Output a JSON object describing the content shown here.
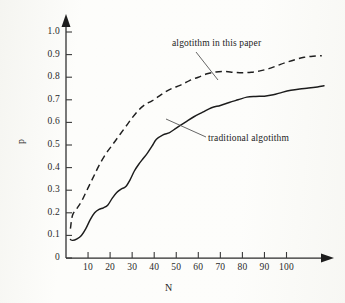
{
  "figure": {
    "kind": "scanned-line-chart",
    "background_color": "#fdfdfb",
    "ink_color": "#1f1f1f"
  },
  "axes": {
    "y_title": "p",
    "x_title": "N",
    "y_tick_labels": [
      "1.0",
      "0.9",
      "0.8",
      "0.7",
      "0.6",
      "0.5",
      "0.4",
      "0.3",
      "0.2",
      "0.1",
      "0"
    ],
    "x_tick_labels": [
      "10",
      "20",
      "30",
      "40",
      "50",
      "60",
      "70",
      "80",
      "90",
      "100"
    ]
  },
  "annotations": {
    "upper": "algotithm in this paper",
    "lower": "traditional algotithm"
  },
  "chart_data": {
    "type": "line",
    "title": "",
    "xlabel": "N",
    "ylabel": "p",
    "xlim": [
      0,
      118
    ],
    "ylim": [
      0,
      1.0
    ],
    "grid": false,
    "legend": "inline-annotations",
    "x_ticks": [
      10,
      20,
      30,
      40,
      50,
      60,
      70,
      80,
      90,
      100
    ],
    "y_ticks": [
      0,
      0.1,
      0.2,
      0.3,
      0.4,
      0.5,
      0.6,
      0.7,
      0.8,
      0.9,
      1.0
    ],
    "series": [
      {
        "name": "algotithm in this paper",
        "style": "dashed",
        "x": [
          2,
          3,
          5,
          7,
          9,
          11,
          13,
          15,
          18,
          21,
          24,
          27,
          30,
          33,
          36,
          39,
          42,
          45,
          48,
          52,
          56,
          60,
          64,
          68,
          72,
          76,
          80,
          84,
          88,
          92,
          96,
          100,
          104,
          108,
          112,
          116
        ],
        "y": [
          0.13,
          0.19,
          0.22,
          0.25,
          0.29,
          0.33,
          0.37,
          0.41,
          0.46,
          0.5,
          0.54,
          0.58,
          0.62,
          0.655,
          0.68,
          0.695,
          0.715,
          0.735,
          0.75,
          0.765,
          0.785,
          0.8,
          0.815,
          0.823,
          0.825,
          0.822,
          0.82,
          0.822,
          0.828,
          0.838,
          0.852,
          0.866,
          0.878,
          0.888,
          0.893,
          0.895
        ]
      },
      {
        "name": "traditional algotithm",
        "style": "solid",
        "x": [
          2,
          3,
          5,
          7,
          9,
          11,
          13,
          15,
          17,
          19,
          21,
          23,
          25,
          27,
          29,
          31,
          33,
          35,
          37,
          39,
          41,
          44,
          47,
          50,
          54,
          58,
          62,
          66,
          70,
          74,
          78,
          82,
          86,
          90,
          94,
          98,
          102,
          106,
          110,
          114,
          117
        ],
        "y": [
          0.082,
          0.078,
          0.085,
          0.1,
          0.13,
          0.17,
          0.2,
          0.215,
          0.222,
          0.235,
          0.265,
          0.29,
          0.305,
          0.315,
          0.345,
          0.385,
          0.415,
          0.44,
          0.465,
          0.495,
          0.525,
          0.545,
          0.555,
          0.575,
          0.6,
          0.625,
          0.645,
          0.665,
          0.675,
          0.688,
          0.7,
          0.712,
          0.715,
          0.716,
          0.722,
          0.733,
          0.742,
          0.748,
          0.752,
          0.757,
          0.762
        ]
      }
    ]
  }
}
